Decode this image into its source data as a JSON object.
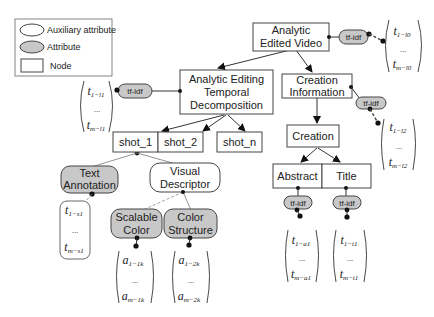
{
  "legend": {
    "items": [
      {
        "shape": "auxiliary-ellipse",
        "label": "Auxiliary attribute"
      },
      {
        "shape": "attribute-ellipse",
        "label": "Attribute"
      },
      {
        "shape": "node-rect",
        "label": "Node"
      }
    ]
  },
  "nodes": {
    "root": {
      "line1": "Analytic",
      "line2": "Edited Video"
    },
    "temporal": {
      "line1": "Analytic  Editing",
      "line2": "Temporal",
      "line3": "Decomposition"
    },
    "creation_info": {
      "line1": "Creation",
      "line2": "Information"
    },
    "creation": {
      "label": "Creation"
    },
    "abstract": {
      "label": "Abstract"
    },
    "title": {
      "label": "Title"
    },
    "shot_1": {
      "label": "shot_1"
    },
    "shot_2": {
      "label": "shot_2"
    },
    "shot_n": {
      "label": "shot_n"
    }
  },
  "attributes": {
    "tfidf": "tf-idf",
    "text_annotation": {
      "line1": "Text",
      "line2": "Annotation"
    },
    "scalable_color": {
      "line1": "Scalable",
      "line2": "Color"
    },
    "color_structure": {
      "line1": "Color",
      "line2": "Structure"
    }
  },
  "auxiliary": {
    "visual_descriptor": {
      "line1": "Visual",
      "line2": "Descriptor"
    }
  },
  "vectors": {
    "root": {
      "top": "t",
      "top_sub": "1−l0",
      "dots": "...",
      "bottom": "t",
      "bottom_sub": "m−l0"
    },
    "temporal": {
      "top": "t",
      "top_sub": "1−l1",
      "dots": "...",
      "bottom": "t",
      "bottom_sub": "m−l1"
    },
    "creation_info": {
      "top": "t",
      "top_sub": "1−l2",
      "dots": "...",
      "bottom": "t",
      "bottom_sub": "m−l2"
    },
    "text_annotation": {
      "top": "t",
      "top_sub": "1−s1",
      "dots": "...",
      "bottom": "t",
      "bottom_sub": "m−s1"
    },
    "scalable_color": {
      "top": "a",
      "top_sub": "1−1k",
      "dots": "...",
      "bottom": "a",
      "bottom_sub": "m−1k"
    },
    "color_structure": {
      "top": "a",
      "top_sub": "1−2k",
      "dots": "...",
      "bottom": "a",
      "bottom_sub": "m−2k"
    },
    "abstract": {
      "top": "t",
      "top_sub": "1−a1",
      "dots": "...",
      "bottom": "t",
      "bottom_sub": "m−a1"
    },
    "title": {
      "top": "t",
      "top_sub": "1−t1",
      "dots": "...",
      "bottom": "t",
      "bottom_sub": "m−t1"
    }
  }
}
